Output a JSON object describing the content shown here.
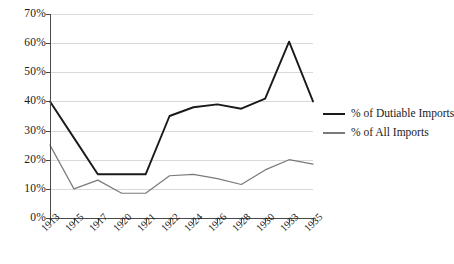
{
  "chart_data": {
    "type": "line",
    "title": "",
    "subtitle": "",
    "xlabel": "",
    "ylabel": "",
    "categories": [
      "1913",
      "1915",
      "1917",
      "1920",
      "1921",
      "1922",
      "1924",
      "1926",
      "1928",
      "1930",
      "1933",
      "1935"
    ],
    "series": [
      {
        "name": "% of Dutiable Imports",
        "color": "#1a1a1a",
        "values": [
          40,
          27.5,
          15,
          15,
          15,
          35,
          38,
          39,
          37.5,
          41,
          60.5,
          40
        ]
      },
      {
        "name": "% of All Imports",
        "color": "#7a7a7a",
        "values": [
          25,
          10,
          13,
          8.5,
          8.5,
          14.5,
          15,
          13.5,
          11.5,
          16.5,
          20,
          18.5
        ]
      }
    ],
    "ylim": [
      0,
      70
    ],
    "ytick_values": [
      0,
      10,
      20,
      30,
      40,
      50,
      60,
      70
    ],
    "ytick_labels": [
      "0%",
      "10%",
      "20%",
      "30%",
      "40%",
      "50%",
      "60%",
      "70%"
    ],
    "grid": true,
    "grid_color": "#d9d9d9",
    "axis_color": "#4a4a4a",
    "legend_position": "right",
    "legend": [
      {
        "label": "% of Dutiable Imports",
        "color": "#1a1a1a"
      },
      {
        "label": "% of All Imports",
        "color": "#7a7a7a"
      }
    ],
    "background": "#ffffff"
  }
}
